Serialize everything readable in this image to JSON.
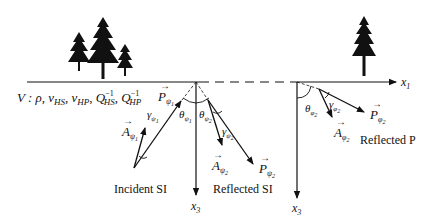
{
  "diagram": {
    "type": "reflection-geometry",
    "medium_label": {
      "prefix": "V : ",
      "rho": "ρ",
      "vHS": "v",
      "vHS_sub": "HS",
      "vHP": "v",
      "vHP_sub": "HP",
      "QHS": "Q",
      "QHS_sub": "HS",
      "QHS_sup": "−1",
      "QHP": "Q",
      "QHP_sub": "HP",
      "QHP_sup": "−1"
    },
    "axes": {
      "x1_label": "x",
      "x1_sub": "1",
      "x3_left_label": "x",
      "x3_left_sub": "3",
      "x3_right_label": "x",
      "x3_right_sub": "3"
    },
    "incident": {
      "caption": "Incident SI",
      "P_label": "P",
      "P_sub": "ψ",
      "P_subsub": "1",
      "A_label": "A",
      "A_sub": "ψ",
      "A_subsub": "1",
      "gamma_label": "γ",
      "gamma_sub": "ψ",
      "gamma_subsub": "1",
      "theta_label": "θ",
      "theta_sub": "ψ",
      "theta_subsub": "1"
    },
    "reflected_si": {
      "caption": "Reflected SI",
      "P_label": "P",
      "P_sub": "ψ",
      "P_subsub": "2",
      "A_label": "A",
      "A_sub": "ψ",
      "A_subsub": "2",
      "gamma_label": "γ",
      "gamma_sub": "ψ",
      "gamma_subsub": "2",
      "theta_label": "θ",
      "theta_sub": "ψ",
      "theta_subsub": "2"
    },
    "reflected_p": {
      "caption": "Reflected P",
      "P_label": "P",
      "P_sub": "φ",
      "P_subsub": "2",
      "A_label": "A",
      "A_sub": "φ",
      "A_subsub": "2",
      "gamma_label": "γ",
      "gamma_sub": "φ",
      "gamma_subsub": "2",
      "theta_label": "θ",
      "theta_sub": "φ",
      "theta_subsub": "2"
    },
    "vector_arrow": "→",
    "colors": {
      "ink": "#111111",
      "background": "#ffffff"
    }
  }
}
